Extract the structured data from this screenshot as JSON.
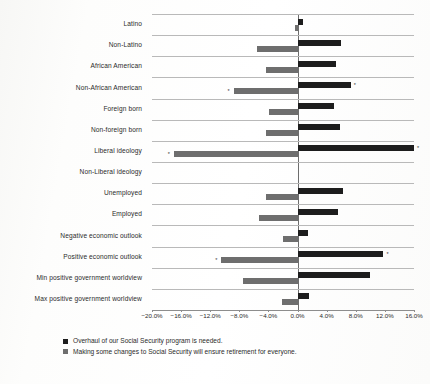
{
  "chart_data": {
    "type": "bar",
    "title": "",
    "subtitle": "",
    "xlabel": "",
    "ylabel": "",
    "orientation": "horizontal",
    "xlim": [
      -20.0,
      16.0
    ],
    "grid": false,
    "legend_position": "bottom-left",
    "axis_tick_labels": [
      "−20.0%",
      "−16.0%",
      "−12.0%",
      "−8.0%",
      "−4.0%",
      "0.0%",
      "4.0%",
      "8.0%",
      "12.0%",
      "16.0%"
    ],
    "axis_tick_values": [
      -20.0,
      -16.0,
      -12.0,
      -8.0,
      -4.0,
      0.0,
      4.0,
      8.0,
      12.0,
      16.0
    ],
    "categories": [
      "Latino",
      "Non-Latino",
      "African American",
      "Non-African American",
      "Foreign born",
      "Non-foreign born",
      "Liberal ideology",
      "Non-Liberal ideology",
      "Unemployed",
      "Employed",
      "Negative economic outlook",
      "Positive economic outlook",
      "Min positive government worldview",
      "Max positive government worldview"
    ],
    "series": [
      {
        "name": "Overhaul of our Social Security program is needed.",
        "color": "#1d1d1d",
        "values": [
          0.7,
          6.0,
          5.3,
          7.3,
          5.0,
          5.9,
          16.0,
          0.0,
          6.2,
          5.5,
          1.5,
          11.8,
          10.0,
          1.6
        ],
        "significant": [
          false,
          false,
          false,
          true,
          false,
          false,
          true,
          false,
          false,
          false,
          false,
          true,
          false,
          false
        ]
      },
      {
        "name": "Making some changes to Social Security will ensure retirement for everyone.",
        "color": "#6e6e6e",
        "values": [
          -0.4,
          -5.6,
          -4.3,
          -8.8,
          -3.9,
          -4.4,
          -17.0,
          0.0,
          -4.3,
          -5.3,
          -2.0,
          -10.5,
          -7.5,
          -2.2
        ],
        "significant": [
          false,
          false,
          false,
          true,
          false,
          false,
          true,
          false,
          false,
          false,
          false,
          true,
          false,
          false
        ]
      }
    ],
    "significance_marker": "*"
  },
  "legend": {
    "entries": [
      {
        "swatch": "dark",
        "label": "Overhaul of our Social Security program is needed."
      },
      {
        "swatch": "gray",
        "label": "Making some changes to Social Security will ensure retirement for everyone."
      }
    ]
  }
}
